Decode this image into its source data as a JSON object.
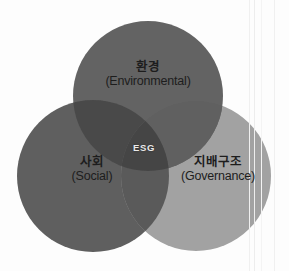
{
  "diagram": {
    "type": "venn",
    "title_center": "ESG",
    "background_color": "#fdfdfd",
    "text_color": "#1d1d1d",
    "center_text_color": "#e9e9e9",
    "circles": [
      {
        "id": "environmental",
        "label_ko": "환경",
        "label_en": "(Environmental)",
        "color": "#646464",
        "cx": 148,
        "cy": 96,
        "r": 75
      },
      {
        "id": "social",
        "label_ko": "사회",
        "label_en": "(Social)",
        "color": "#5f5f5f",
        "cx": 93,
        "cy": 176,
        "r": 76
      },
      {
        "id": "governance",
        "label_ko": "지배구조",
        "label_en": "(Governance)",
        "color": "#a2a2a2",
        "cx": 196,
        "cy": 176,
        "r": 75
      }
    ],
    "overlaps": {
      "environmental_social": "#4a4a4a",
      "environmental_governance": "#616161",
      "social_governance": "#5a5a5a",
      "center": "#454545"
    }
  }
}
